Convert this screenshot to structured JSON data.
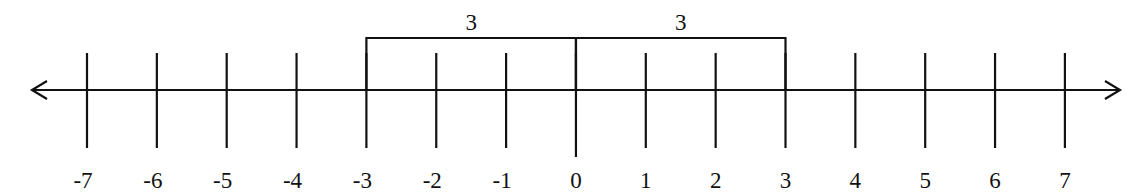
{
  "diagram": {
    "type": "number_line",
    "min": -7,
    "max": 7,
    "ticks": [
      -7,
      -6,
      -5,
      -4,
      -3,
      -2,
      -1,
      0,
      1,
      2,
      3,
      4,
      5,
      6,
      7
    ],
    "tick_labels": [
      "-7",
      "-6",
      "-5",
      "-4",
      "-3",
      "-2",
      "-1",
      "0",
      "1",
      "2",
      "3",
      "4",
      "5",
      "6",
      "7"
    ],
    "arrows": {
      "left": true,
      "right": true
    },
    "brackets": [
      {
        "from": -3,
        "to": 0,
        "label": "3"
      },
      {
        "from": 0,
        "to": 3,
        "label": "3"
      }
    ],
    "colors": {
      "line": "#111111",
      "background": "#ffffff"
    }
  }
}
